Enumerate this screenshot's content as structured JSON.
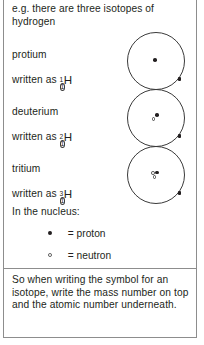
{
  "page": {
    "intro": "e.g. there are three isotopes of hydrogen",
    "closing": "So when writing the symbol for an isotope, write the mass number on top and the atomic number underneath.",
    "nucleus_heading": "In the nucleus:",
    "rule_color": "#8d8d8d",
    "text_color": "#231f20"
  },
  "isotopes": [
    {
      "name": "protium",
      "written_as": "written as",
      "mass_number": "1",
      "atomic_number": "1",
      "element_symbol": "H",
      "protons": 1,
      "neutrons": 0,
      "electrons": 1
    },
    {
      "name": "deuterium",
      "written_as": "written as",
      "mass_number": "2",
      "atomic_number": "1",
      "element_symbol": "H",
      "protons": 1,
      "neutrons": 1,
      "electrons": 1
    },
    {
      "name": "tritium",
      "written_as": "written as",
      "mass_number": "3",
      "atomic_number": "1",
      "element_symbol": "H",
      "protons": 1,
      "neutrons": 2,
      "electrons": 1
    }
  ],
  "legend": [
    {
      "glyph": "filled-dot-icon",
      "label": "= proton"
    },
    {
      "glyph": "hollow-dot-icon",
      "label": "= neutron"
    }
  ]
}
